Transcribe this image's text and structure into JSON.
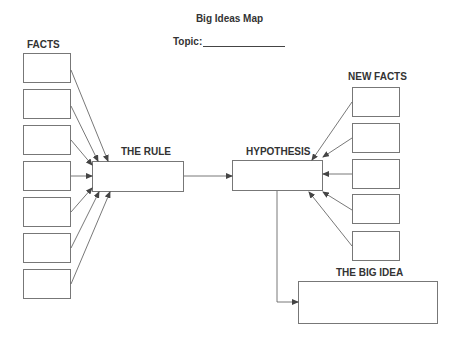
{
  "title": "Big Ideas Map",
  "topic": {
    "label": "Topic:",
    "value": ""
  },
  "sections": {
    "facts": {
      "label": "FACTS",
      "box_count": 7
    },
    "rule": {
      "label": "THE RULE"
    },
    "hypothesis": {
      "label": "HYPOTHESIS"
    },
    "new_facts": {
      "label": "NEW FACTS",
      "box_count": 5
    },
    "big_idea": {
      "label": "THE BIG IDEA"
    }
  },
  "colors": {
    "line": "#555555",
    "box_border": "#777777",
    "text": "#333333"
  }
}
